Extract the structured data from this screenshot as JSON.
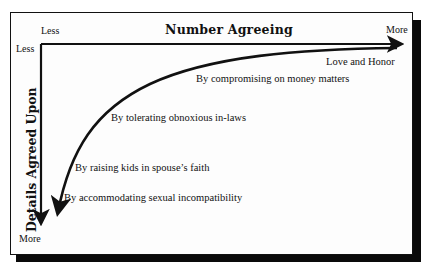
{
  "diagram": {
    "x_axis": {
      "title": "Number Agreeing",
      "start_label": "Less",
      "end_label": "More"
    },
    "y_axis": {
      "title": "Details Agreed Upon",
      "start_label": "Less",
      "end_label": "More"
    },
    "curve_labels": [
      "Love and Honor",
      "By compromising on money matters",
      "By tolerating obnoxious in-laws",
      "By raising kids in spouse’s faith",
      "By accommodating sexual incompatibility"
    ],
    "colors": {
      "ink": "#111111",
      "background": "#fdfdfd",
      "shadow": "#0a0a0a"
    }
  }
}
